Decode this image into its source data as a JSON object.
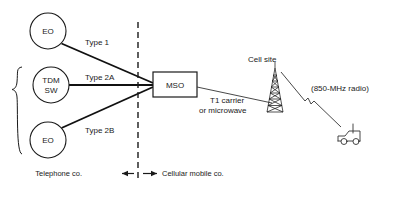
{
  "diagram": {
    "background_color": "#ffffff",
    "line_color": "#1a1a1a",
    "nodes": [
      {
        "id": "eo_top",
        "label_line1": "EO",
        "label_line2": "",
        "shape": "circle",
        "cx": 48,
        "cy": 31,
        "r": 18
      },
      {
        "id": "tdm_sw",
        "label_line1": "TDM",
        "label_line2": "SW",
        "shape": "circle",
        "cx": 51,
        "cy": 85,
        "r": 18
      },
      {
        "id": "eo_bottom",
        "label_line1": "EO",
        "label_line2": "",
        "shape": "circle",
        "cx": 48,
        "cy": 140,
        "r": 18
      },
      {
        "id": "mso",
        "label_line1": "MSO",
        "label_line2": "",
        "shape": "rect",
        "x": 153,
        "y": 72,
        "w": 44,
        "h": 25
      }
    ],
    "edge_labels": [
      {
        "id": "type1",
        "text": "Type 1",
        "x": 85,
        "y": 45
      },
      {
        "id": "type2a",
        "text": "Type 2A",
        "x": 85,
        "y": 80
      },
      {
        "id": "type2b",
        "text": "Type 2B",
        "x": 85,
        "y": 133
      },
      {
        "id": "t1_carrier_line1",
        "text": "T1 carrier",
        "x": 210,
        "y": 103
      },
      {
        "id": "t1_carrier_line2",
        "text": "or microwave",
        "x": 199,
        "y": 113
      },
      {
        "id": "radio_band",
        "text": "(850-MHz radio)",
        "x": 311,
        "y": 91
      }
    ],
    "annotations": [
      {
        "id": "cell_site",
        "text": "Cell site",
        "x": 248,
        "y": 62
      }
    ],
    "boundary": {
      "divider_x": 138,
      "divider_top": 22,
      "divider_bottom": 181,
      "left_label": "Telephone co.",
      "right_label": "Cellular mobile co.",
      "left_label_x": 82,
      "right_label_x": 172,
      "label_y": 176
    },
    "icons": [
      {
        "id": "tower",
        "name": "cell-tower-icon",
        "x": 270,
        "y": 66
      },
      {
        "id": "car",
        "name": "car-icon",
        "x": 340,
        "y": 131
      },
      {
        "id": "brace",
        "name": "group-brace-icon",
        "x": 14,
        "y": 67
      },
      {
        "id": "radio_zigzag",
        "name": "radio-wave-break-icon",
        "x": 305,
        "y": 100
      }
    ]
  }
}
